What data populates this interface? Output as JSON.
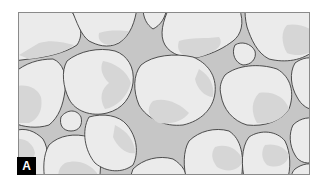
{
  "figure": {
    "panel_label": "A",
    "colors": {
      "matrix": "#c6c6c6",
      "grain_fill": "#ebebeb",
      "grain_shade": "#d6d6d6",
      "grain_outline": "#3c3c3c",
      "frame_border": "#8a8a8a",
      "label_background": "#000000",
      "label_text": "#ffffff"
    }
  }
}
